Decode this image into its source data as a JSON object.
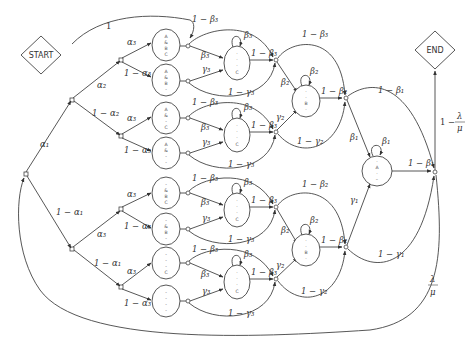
{
  "diagram": {
    "type": "state-transition-diagram",
    "terminals": {
      "start": "START",
      "end": "END"
    },
    "edge_labels": {
      "start_to_first": "1",
      "alpha1": "α₁",
      "one_minus_alpha1": "1 − α₁",
      "alpha2": "α₂",
      "one_minus_alpha2": "1 − α₂",
      "alpha3": "α₃",
      "one_minus_alpha3": "1 − α₃",
      "beta3": "β₃",
      "one_minus_beta3": "1 − β₃",
      "gamma3": "γ₃",
      "one_minus_gamma3": "1 − γ₃",
      "beta2": "β₂",
      "one_minus_beta2": "1 − β₂",
      "gamma2": "γ₂",
      "one_minus_gamma2": "1 − γ₂",
      "beta1": "β₁",
      "one_minus_beta1": "1 − β₁",
      "gamma1": "γ₁",
      "one_minus_gamma1": "1 − γ₁",
      "one_minus_lambda_over_mu_prefix": "1 −",
      "lambda": "λ",
      "mu": "μ"
    },
    "leaf_states": [
      {
        "lines": [
          "A",
          "&",
          "B",
          "C"
        ]
      },
      {
        "lines": [
          "A",
          "&",
          "B",
          "-"
        ]
      },
      {
        "lines": [
          "A",
          "&",
          "-",
          "C"
        ]
      },
      {
        "lines": [
          "A",
          "&",
          "-",
          "-"
        ]
      },
      {
        "lines": [
          "-",
          "&",
          "B",
          "C"
        ]
      },
      {
        "lines": [
          "-",
          "&",
          "B",
          "-"
        ]
      },
      {
        "lines": [
          "-",
          "-",
          "-",
          "C"
        ]
      },
      {
        "lines": [
          "-",
          "-",
          "-",
          "-"
        ]
      }
    ],
    "mid_states": [
      {
        "lines": [
          "·",
          "·",
          "·",
          "C"
        ]
      },
      {
        "lines": [
          "·",
          "·",
          "·",
          "C"
        ]
      },
      {
        "lines": [
          "·",
          "·",
          "·",
          "C"
        ]
      },
      {
        "lines": [
          "·",
          "·",
          "·",
          "C"
        ]
      }
    ],
    "upper_states": [
      {
        "lines": [
          "·",
          "·",
          "B",
          "·"
        ]
      },
      {
        "lines": [
          "·",
          "·",
          "B",
          "·"
        ]
      }
    ],
    "final_state": {
      "lines": [
        "·",
        "A",
        "·",
        "–"
      ]
    }
  }
}
